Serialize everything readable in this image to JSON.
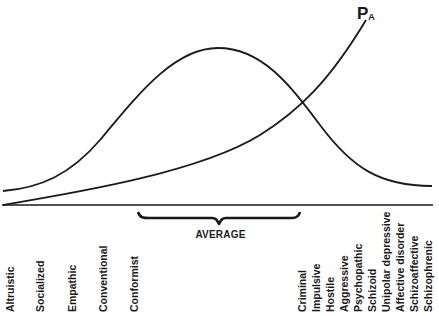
{
  "figure": {
    "curve_label": "P",
    "curve_label_sub": "A",
    "bracket_label": "AVERAGE",
    "colors": {
      "line": "#1a1a1a",
      "background": "#ffffff"
    }
  },
  "traits_left": [
    {
      "label": "Altruistic",
      "x": 6
    },
    {
      "label": "Socialized",
      "x": 36
    },
    {
      "label": "Empathic",
      "x": 68
    },
    {
      "label": "Conventional",
      "x": 99
    },
    {
      "label": "Conformist",
      "x": 130
    }
  ],
  "traits_right": [
    {
      "label": "Criminal",
      "x": 298
    },
    {
      "label": "Impulsive",
      "x": 312
    },
    {
      "label": "Hostile",
      "x": 326
    },
    {
      "label": "Aggressive",
      "x": 340
    },
    {
      "label": "Psychopathic",
      "x": 354
    },
    {
      "label": "Schizoid",
      "x": 368
    },
    {
      "label": "Unipolar depressive",
      "x": 382
    },
    {
      "label": "Affective disorder",
      "x": 396
    },
    {
      "label": "Schizoaffective",
      "x": 410
    },
    {
      "label": "Schizophrenic",
      "x": 424
    }
  ]
}
